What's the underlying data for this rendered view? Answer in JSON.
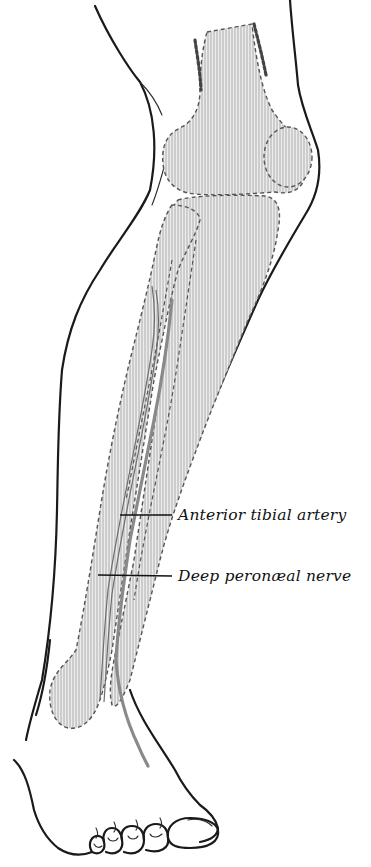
{
  "figure": {
    "style": "engraved anatomical illustration",
    "colors": {
      "outline": "#1a1a1a",
      "bone_hatch": "#9a9a9a",
      "vessel": "#8a8a8a",
      "background": "#ffffff"
    }
  },
  "labels": [
    {
      "id": "anterior-tibial-artery",
      "text": "Anterior tibial artery"
    },
    {
      "id": "deep-peroneal-nerve",
      "text": "Deep peronæal nerve"
    }
  ]
}
